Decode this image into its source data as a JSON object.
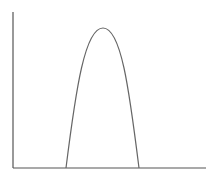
{
  "figure": {
    "colors": {
      "background": "#ffffff",
      "axis": "#555555",
      "curve": "#666666"
    }
  },
  "axes": {
    "origin": [
      13,
      168
    ],
    "y_axis_top": [
      13,
      12
    ],
    "x_axis_end": [
      206,
      168
    ],
    "labels": {
      "x": "",
      "y": ""
    }
  },
  "curve": {
    "type": "peak",
    "left_base": [
      66,
      168
    ],
    "apex": [
      103,
      28
    ],
    "right_base": [
      139,
      168
    ]
  }
}
